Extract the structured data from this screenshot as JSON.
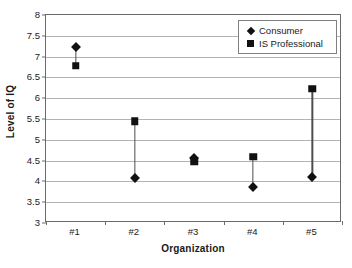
{
  "chart_data": {
    "type": "scatter",
    "title": "",
    "xlabel": "Organization",
    "ylabel": "Level of IQ",
    "categories": [
      "#1",
      "#2",
      "#3",
      "#4",
      "#5"
    ],
    "ylim": [
      3,
      8
    ],
    "yticks": [
      "8",
      "7.5",
      "7",
      "6.5",
      "6",
      "5.5",
      "5",
      "4.5",
      "4",
      "3.5",
      "3"
    ],
    "ytick_values": [
      8,
      7.5,
      7,
      6.5,
      6,
      5.5,
      5,
      4.5,
      4,
      3.5,
      3
    ],
    "grid": true,
    "legend_position": "top-right",
    "series": [
      {
        "name": "Consumer",
        "marker": "diamond",
        "color": "#111111",
        "values": [
          7.23,
          4.08,
          4.57,
          3.86,
          4.1
        ]
      },
      {
        "name": "IS Professional",
        "marker": "square",
        "color": "#111111",
        "values": [
          6.78,
          5.45,
          4.48,
          4.59,
          6.23
        ]
      }
    ],
    "connectors": true
  },
  "legend": {
    "items": [
      {
        "label": "Consumer",
        "marker": "diamond"
      },
      {
        "label": "IS Professional",
        "marker": "square"
      }
    ]
  },
  "colors": {
    "marker": "#111111",
    "gridline": "#b3b3b3",
    "frame": "#6b6b6b",
    "text": "#1a1a1a",
    "background": "#ffffff"
  }
}
